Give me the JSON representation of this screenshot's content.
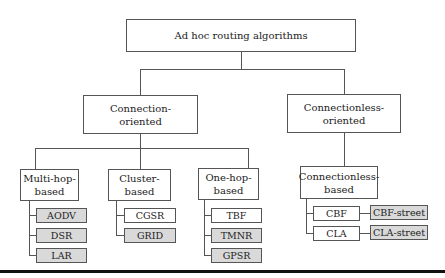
{
  "root": {
    "label": "Ad hoc routing algorithms"
  },
  "level1": [
    {
      "label": "Connection-\noriented"
    },
    {
      "label": "Connectionless-\noriented"
    }
  ],
  "level2": [
    {
      "label": "Multi-hop-\nbased",
      "children": [
        {
          "label": "AODV",
          "shaded": true
        },
        {
          "label": "DSR",
          "shaded": true
        },
        {
          "label": "LAR",
          "shaded": true
        }
      ]
    },
    {
      "label": "Cluster-\nbased",
      "children": [
        {
          "label": "CGSR",
          "shaded": false
        },
        {
          "label": "GRID",
          "shaded": true
        }
      ]
    },
    {
      "label": "One-hop-\nbased",
      "children": [
        {
          "label": "TBF",
          "shaded": false
        },
        {
          "label": "TMNR",
          "shaded": true
        },
        {
          "label": "GPSR",
          "shaded": true
        }
      ]
    },
    {
      "label": "Connectionless-\nbased",
      "children": [
        {
          "label": "CBF",
          "shaded": false,
          "extension": {
            "label": "CBF-street",
            "shaded": true
          }
        },
        {
          "label": "CLA",
          "shaded": false,
          "extension": {
            "label": "CLA-street",
            "shaded": true
          }
        }
      ]
    }
  ],
  "colors": {
    "shaded": "#d9d9d9",
    "border": "#555555",
    "rule": "#111111"
  }
}
